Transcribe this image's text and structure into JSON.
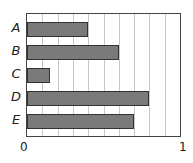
{
  "chart_data": {
    "type": "bar",
    "orientation": "horizontal",
    "title": "",
    "xlabel": "",
    "ylabel": "",
    "categories": [
      "A",
      "B",
      "C",
      "D",
      "E"
    ],
    "values": [
      0.4,
      0.6,
      0.15,
      0.8,
      0.7
    ],
    "xlim": [
      0,
      1
    ],
    "x_tick_labels": [
      "0",
      "1"
    ],
    "grid": "vertical lines every 0.1",
    "bar_color": "#7a7a7a",
    "legend": null
  }
}
